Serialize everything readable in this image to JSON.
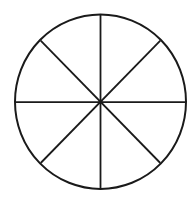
{
  "diagram": {
    "type": "circle-divided-into-sectors",
    "sectors": 8,
    "stroke_color": "#1a1a1a",
    "background_color": "#ffffff",
    "circle": {
      "cx": 100.5,
      "cy": 101.7,
      "rx": 85.5,
      "ry": 87.2
    },
    "center": {
      "x": 100.5,
      "y": 101.7
    },
    "spokes": [
      {
        "name": "vertical",
        "x1": 100.5,
        "y1": 14.5,
        "x2": 100.5,
        "y2": 189
      },
      {
        "name": "horizontal",
        "x1": 15,
        "y1": 102.2,
        "x2": 186,
        "y2": 102.2
      },
      {
        "name": "diagonal-down",
        "x1": 40.7,
        "y1": 40.7,
        "x2": 160.3,
        "y2": 163
      },
      {
        "name": "diagonal-up",
        "x1": 160.3,
        "y1": 40.7,
        "x2": 40.7,
        "y2": 163
      }
    ]
  }
}
